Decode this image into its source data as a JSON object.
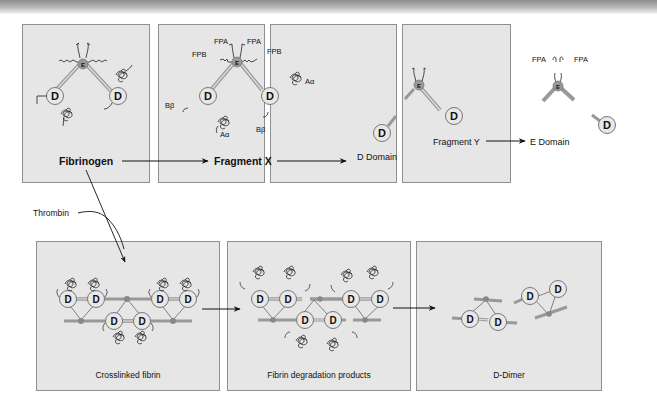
{
  "figure": {
    "topbar_gradient": [
      "#8c8c8c",
      "#f4f4f4"
    ],
    "panel_bg": "#e6e6e6",
    "panel_border": "#8f8f8f",
    "top_row": [
      {
        "id": "fibrinogen",
        "label": "Fibrinogen",
        "bold": true,
        "annotations": []
      },
      {
        "id": "fragment-x",
        "label": "Fragment X",
        "bold": true,
        "annotations": [
          "FPA",
          "FPA",
          "FPB",
          "FPB",
          "Aα",
          "Aα",
          "Bβ",
          "Bβ"
        ]
      },
      {
        "id": "d-domain-fragment-y",
        "labels": [
          "D Domain",
          "Fragment Y"
        ]
      },
      {
        "id": "e-domain",
        "label": "E Domain",
        "annotations": [
          "FPA",
          "FPA"
        ]
      }
    ],
    "bottom_row": [
      {
        "id": "crosslinked-fibrin",
        "label": "Crosslinked fibrin"
      },
      {
        "id": "fibrin-degradation-products",
        "label": "Fibrin degradation products"
      },
      {
        "id": "d-dimer",
        "label": "D-Dimer"
      }
    ],
    "enzyme_label": "Thrombin",
    "domain_letters": {
      "d": "D",
      "e": "E"
    },
    "text": {
      "fibrinogen": "Fibrinogen",
      "fragment_x": "Fragment X",
      "d_domain": "D Domain",
      "fragment_y": "Fragment Y",
      "e_domain": "E Domain",
      "crosslinked": "Crosslinked fibrin",
      "fdp": "Fibrin degradation products",
      "d_dimer": "D-Dimer",
      "thrombin": "Thrombin",
      "fpa": "FPA",
      "fpb": "FPB",
      "a_alpha": "Aα",
      "b_beta": "Bβ"
    }
  }
}
